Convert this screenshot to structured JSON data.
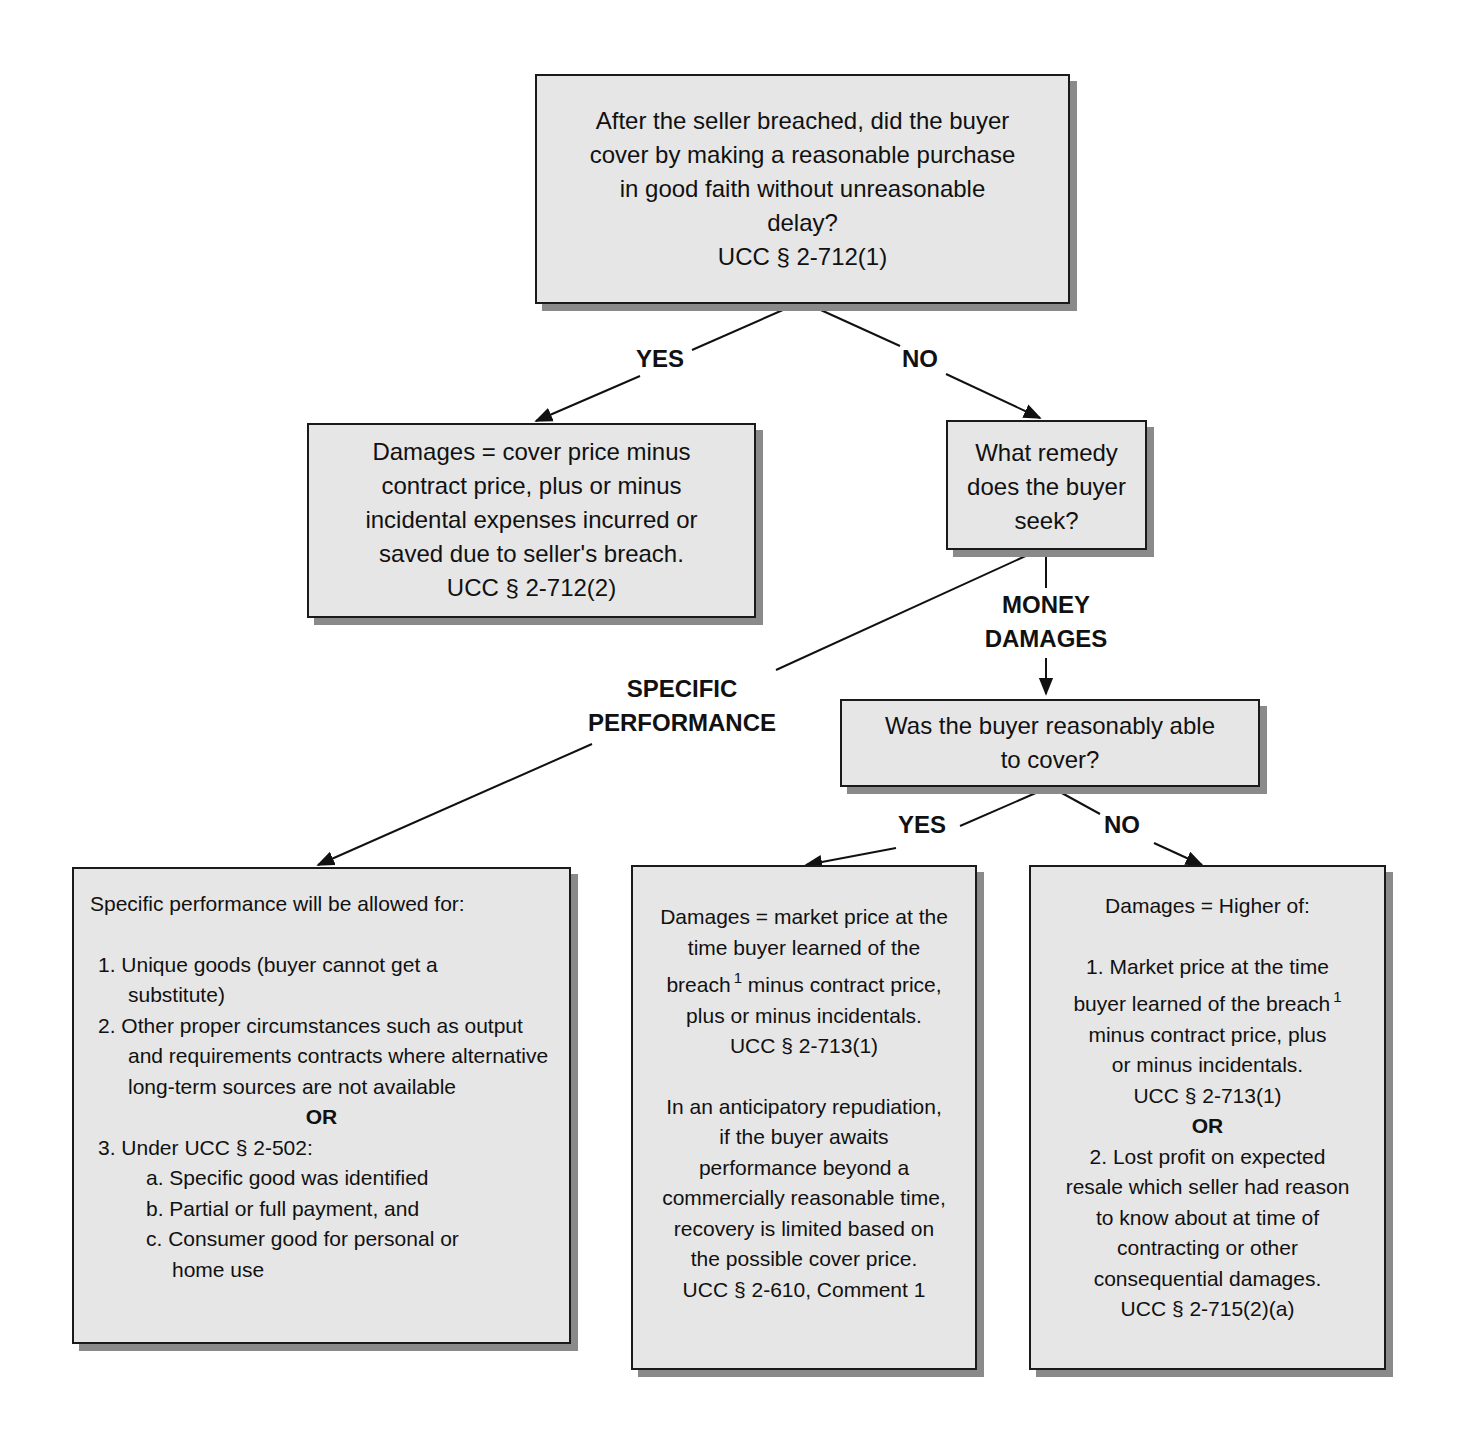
{
  "nodes": {
    "root": {
      "lines": [
        "After the seller breached, did the buyer",
        "cover by making a reasonable purchase",
        "in good faith without unreasonable",
        "delay?",
        "UCC § 2-712(1)"
      ]
    },
    "cover_damages": {
      "lines": [
        "Damages = cover price minus",
        "contract price, plus or minus",
        "incidental expenses incurred or",
        "saved due to seller's breach.",
        "UCC § 2-712(2)"
      ]
    },
    "remedy_question": {
      "lines": [
        "What remedy",
        "does the buyer",
        "seek?"
      ]
    },
    "able_to_cover": {
      "lines": [
        "Was the buyer reasonably able",
        "to cover?"
      ]
    },
    "specific_performance": {
      "intro": "Specific performance will be allowed for:",
      "item1": "1. Unique goods (buyer cannot get a substitute)",
      "item2": "2. Other proper circumstances such as output and requirements contracts where alternative long-term sources are not available",
      "or": "OR",
      "item3": "3. Under UCC § 2-502:",
      "sub_a": "a. Specific good was identified",
      "sub_b": "b. Partial or full payment, and",
      "sub_c": "c. Consumer good for personal or home use"
    },
    "market_damages": {
      "line1": "Damages = market price at the",
      "line2": "time buyer learned of the",
      "line3a": "breach",
      "footnote": "1",
      "line3b": " minus contract price,",
      "line4": "plus or minus incidentals.",
      "cite1": "UCC § 2-713(1)",
      "para2": [
        "In an anticipatory repudiation,",
        "if the buyer awaits",
        "performance beyond a",
        "commercially reasonable time,",
        "recovery is limited based on",
        "the possible cover price.",
        "UCC § 2-610, Comment 1"
      ]
    },
    "higher_of": {
      "title": "Damages = Higher of:",
      "item1_l1": "1. Market price at the time",
      "item1_l2": "buyer learned of the breach",
      "footnote": "1",
      "item1_l3": "minus contract price, plus",
      "item1_l4": "or minus incidentals.",
      "cite1": "UCC § 2-713(1)",
      "or": "OR",
      "item2": [
        "2. Lost profit on expected",
        "resale which seller had reason",
        "to know about at time of",
        "contracting or other",
        "consequential damages."
      ],
      "cite2": "UCC § 2-715(2)(a)"
    }
  },
  "edges": {
    "root_yes": "YES",
    "root_no": "NO",
    "money_damages_1": "MONEY",
    "money_damages_2": "DAMAGES",
    "specific_1": "SPECIFIC",
    "specific_2": "PERFORMANCE",
    "cover_yes": "YES",
    "cover_no": "NO"
  },
  "colors": {
    "box_fill": "#e6e6e6",
    "box_border": "#1a1a1a",
    "box_shadow": "#8a8a8a",
    "line": "#111111"
  }
}
